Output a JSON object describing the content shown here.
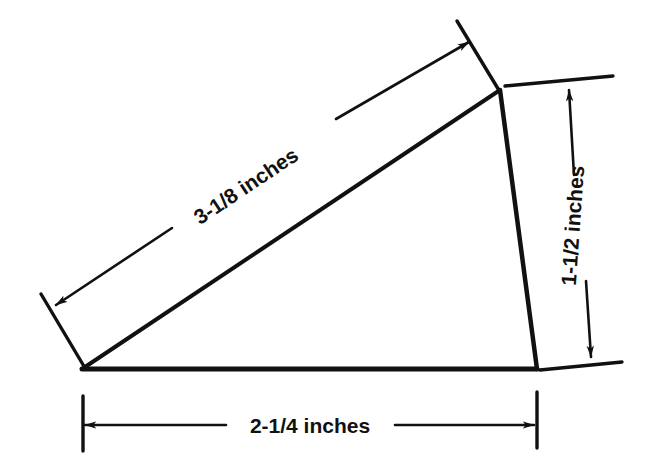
{
  "figure": {
    "type": "engineering-dimension-diagram",
    "background_color": "#ffffff",
    "line_color": "#111111"
  },
  "shape": {
    "name": "triangle",
    "vertices": [
      {
        "name": "bottom-left",
        "x": 82,
        "y": 369
      },
      {
        "name": "top-right",
        "x": 500,
        "y": 90
      },
      {
        "name": "bottom-right",
        "x": 537,
        "y": 369
      }
    ]
  },
  "dimensions": [
    {
      "id": "hypotenuse",
      "label": "3-1/8 inches",
      "value": 3.125,
      "unit": "inches",
      "edge": "bottom-left-to-top-right",
      "text_x": 250,
      "text_y": 192,
      "text_rotation": -33.7,
      "leader_from": {
        "x": 55,
        "y": 305
      },
      "leader_to": {
        "x": 470,
        "y": 41
      },
      "arrows": "both"
    },
    {
      "id": "vertical-right",
      "label": "1-1/2 inches",
      "value": 1.5,
      "unit": "inches",
      "edge": "top-right-to-bottom-right",
      "text_x": 580,
      "text_y": 226,
      "text_rotation": -86,
      "leader_from": {
        "x": 570,
        "y": 90
      },
      "leader_to": {
        "x": 592,
        "y": 357
      },
      "arrows": "both"
    },
    {
      "id": "base-horizontal",
      "label": "2-1/4 inches",
      "value": 2.25,
      "unit": "inches",
      "edge": "bottom-left-to-bottom-right",
      "text_x": 310,
      "text_y": 433,
      "text_rotation": 0,
      "leader_from": {
        "x": 84,
        "y": 425
      },
      "leader_to": {
        "x": 535,
        "y": 425
      },
      "arrows": "both"
    }
  ]
}
